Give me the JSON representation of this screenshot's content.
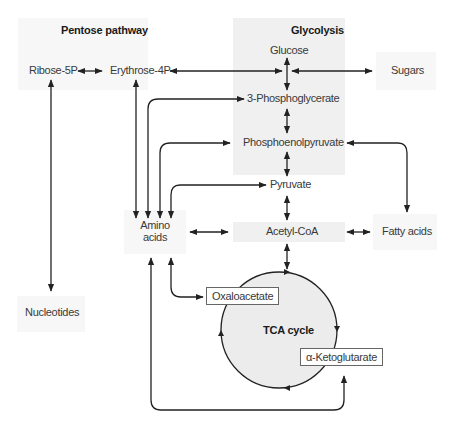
{
  "sections": {
    "pentose": "Pentose pathway",
    "glycolysis": "Glycolysis",
    "tca": "TCA cycle"
  },
  "nodes": {
    "ribose5p": "Ribose-5P",
    "erythrose4p": "Erythrose-4P",
    "glucose": "Glucose",
    "sugars": "Sugars",
    "phosphoglycerate": "3-Phosphoglycerate",
    "pep": "Phosphoenolpyruvate",
    "pyruvate": "Pyruvate",
    "amino_line1": "Amino",
    "amino_line2": "acids",
    "acetylcoa": "Acetyl-CoA",
    "fattyacids": "Fatty acids",
    "nucleotides": "Nucleotides",
    "oxaloacetate": "Oxaloacetate",
    "ketoglutarate": "α-Ketoglutarate"
  },
  "colors": {
    "panel": "#f0f0f0",
    "circle_fill": "#ececec",
    "line": "#222222"
  }
}
